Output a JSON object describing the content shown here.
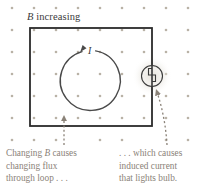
{
  "diagram": {
    "colors": {
      "background": "#ffffff",
      "wire": "#2b2b2b",
      "field_dot": "#b9b2a6",
      "arrow": "#4a4a4a",
      "caption_text": "#8a8278",
      "label_text": "#3b3b3b",
      "bulb_glow": "#e8e4dc"
    },
    "field": {
      "name": "magnetic-field-dots",
      "description": "grid of dots representing magnetic field out of the page",
      "dot_radius": 1.3,
      "spacing_x": 22,
      "spacing_y": 22,
      "origin_x": 12,
      "origin_y": 8,
      "columns": 9,
      "rows": 6
    },
    "b_label": {
      "symbol": "B",
      "text": " increasing",
      "full": "B increasing"
    },
    "loop": {
      "name": "wire-loop-rectangle",
      "x": 30,
      "y": 28,
      "width": 122,
      "height": 98,
      "stroke_width": 1.8
    },
    "current": {
      "label": "I",
      "direction": "counterclockwise",
      "center_x": 91,
      "center_y": 80,
      "radius": 30
    },
    "bulb": {
      "name": "light-bulb",
      "center_x": 152,
      "center_y": 76,
      "radius": 11,
      "filament": "S-shaped zigzag"
    },
    "pointers": [
      {
        "name": "flux-pointer-arrow",
        "style": "dashed",
        "from": "left caption",
        "to": "loop bottom edge"
      },
      {
        "name": "bulb-pointer-arrow",
        "style": "dashed-curved",
        "from": "right caption",
        "to": "light bulb"
      }
    ],
    "captions": {
      "left": {
        "line1_pre": "Changing ",
        "line1_sym": "B",
        "line1_post": " causes",
        "line2": "changing flux",
        "line3": "through loop . . ."
      },
      "right": {
        "line1": ". . . which causes",
        "line2": "induced current",
        "line3": "that lights bulb."
      }
    }
  }
}
